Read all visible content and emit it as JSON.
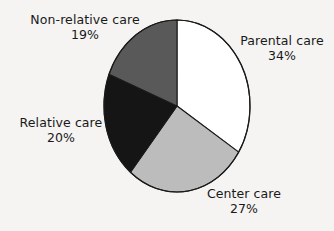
{
  "chart_data": {
    "type": "pie",
    "title": "",
    "subtitle": "",
    "xlabel": "",
    "ylabel": "",
    "legend_position": "none",
    "grid": false,
    "units": "percent",
    "start_angle_deg": 0,
    "direction": "clockwise",
    "categories": [
      "Parental care",
      "Center care",
      "Relative care",
      "Non-relative care"
    ],
    "values": [
      34,
      27,
      20,
      19
    ],
    "slices": [
      {
        "label": "Parental care",
        "value": 34,
        "percent_text": "34%",
        "color": "#ffffff",
        "start_deg": 0,
        "end_deg": 122.4,
        "label_position": "right"
      },
      {
        "label": "Center care",
        "value": 27,
        "percent_text": "27%",
        "color": "#bcbcbc",
        "start_deg": 122.4,
        "end_deg": 219.6,
        "label_position": "bottom"
      },
      {
        "label": "Relative care",
        "value": 20,
        "percent_text": "20%",
        "color": "#151515",
        "start_deg": 219.6,
        "end_deg": 291.6,
        "label_position": "left"
      },
      {
        "label": "Non-relative care",
        "value": 19,
        "percent_text": "19%",
        "color": "#595959",
        "start_deg": 291.6,
        "end_deg": 360,
        "label_position": "top-left"
      }
    ],
    "outline_color": "#1a1a1a",
    "background_color": "#f5f4f2"
  },
  "labels": {
    "non_relative": {
      "name": "Non-relative care",
      "percent": "19%"
    },
    "parental": {
      "name": "Parental care",
      "percent": "34%"
    },
    "relative": {
      "name": "Relative care",
      "percent": "20%"
    },
    "center": {
      "name": "Center care",
      "percent": "27%"
    }
  }
}
